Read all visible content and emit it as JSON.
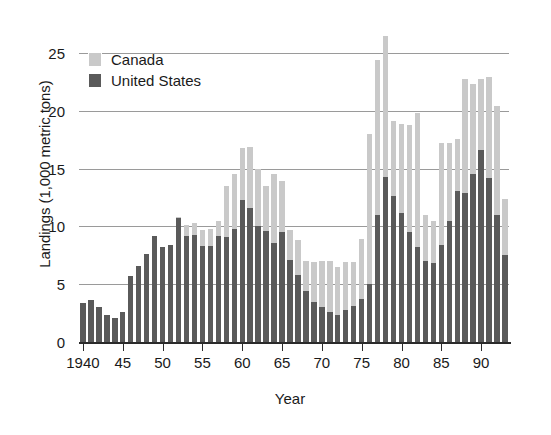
{
  "chart_data": {
    "type": "bar",
    "stacked": true,
    "title": "",
    "xlabel": "Year",
    "ylabel": "Landings (1,000 metric tons)",
    "ylim": [
      0,
      27
    ],
    "yticks": [
      0,
      5,
      10,
      15,
      20,
      25
    ],
    "ytick_labels": [
      "0",
      "5",
      "10",
      "15",
      "20",
      "25"
    ],
    "xtick_values": [
      1940,
      1945,
      1950,
      1955,
      1960,
      1965,
      1970,
      1975,
      1980,
      1985,
      1990
    ],
    "xtick_labels": [
      "1940",
      "45",
      "50",
      "55",
      "60",
      "65",
      "70",
      "75",
      "80",
      "85",
      "90"
    ],
    "grid": "horizontal",
    "legend_position": "upper-left-inside",
    "colors": {
      "canada": "#c9c9c9",
      "united_states": "#5a5a5a",
      "gridline": "#9a9a9a",
      "axis": "#2b2b2b",
      "background": "#ffffff"
    },
    "legend": [
      {
        "name": "Canada",
        "color": "#c9c9c9"
      },
      {
        "name": "United States",
        "color": "#5a5a5a"
      }
    ],
    "categories": [
      1940,
      1941,
      1942,
      1943,
      1944,
      1945,
      1946,
      1947,
      1948,
      1949,
      1950,
      1951,
      1952,
      1953,
      1954,
      1955,
      1956,
      1957,
      1958,
      1959,
      1960,
      1961,
      1962,
      1963,
      1964,
      1965,
      1966,
      1967,
      1968,
      1969,
      1970,
      1971,
      1972,
      1973,
      1974,
      1975,
      1976,
      1977,
      1978,
      1979,
      1980,
      1981,
      1982,
      1983,
      1984,
      1985,
      1986,
      1987,
      1988,
      1989,
      1990,
      1991,
      1992,
      1993
    ],
    "series": [
      {
        "name": "United States",
        "color": "#5a5a5a",
        "values": [
          3.4,
          3.6,
          3.0,
          2.3,
          2.1,
          2.6,
          5.7,
          6.6,
          7.6,
          9.2,
          8.2,
          8.4,
          10.7,
          9.2,
          9.3,
          8.3,
          8.3,
          9.2,
          9.1,
          9.8,
          12.3,
          11.6,
          10.0,
          9.6,
          8.6,
          9.5,
          7.1,
          5.8,
          4.4,
          3.5,
          3.0,
          2.6,
          2.3,
          2.8,
          3.1,
          3.7,
          5.0,
          11.0,
          14.3,
          12.6,
          11.2,
          9.5,
          8.2,
          7.0,
          6.8,
          8.4,
          10.5,
          13.1,
          12.9,
          14.5,
          16.6,
          14.2,
          11.0,
          7.5
        ]
      },
      {
        "name": "Canada",
        "color": "#c9c9c9",
        "values": [
          0.0,
          0.0,
          0.0,
          0.0,
          0.0,
          0.0,
          0.0,
          0.0,
          0.0,
          0.0,
          0.0,
          0.0,
          0.1,
          0.9,
          1.0,
          1.4,
          1.5,
          1.3,
          4.4,
          4.7,
          4.5,
          5.3,
          5.0,
          3.9,
          5.9,
          4.4,
          2.6,
          3.0,
          2.6,
          3.4,
          4.0,
          4.4,
          4.2,
          4.1,
          3.8,
          5.2,
          13.0,
          13.4,
          12.2,
          6.5,
          7.7,
          9.3,
          11.6,
          4.0,
          3.7,
          8.8,
          6.7,
          4.5,
          9.9,
          7.8,
          6.2,
          8.7,
          9.4,
          4.9
        ]
      }
    ]
  }
}
